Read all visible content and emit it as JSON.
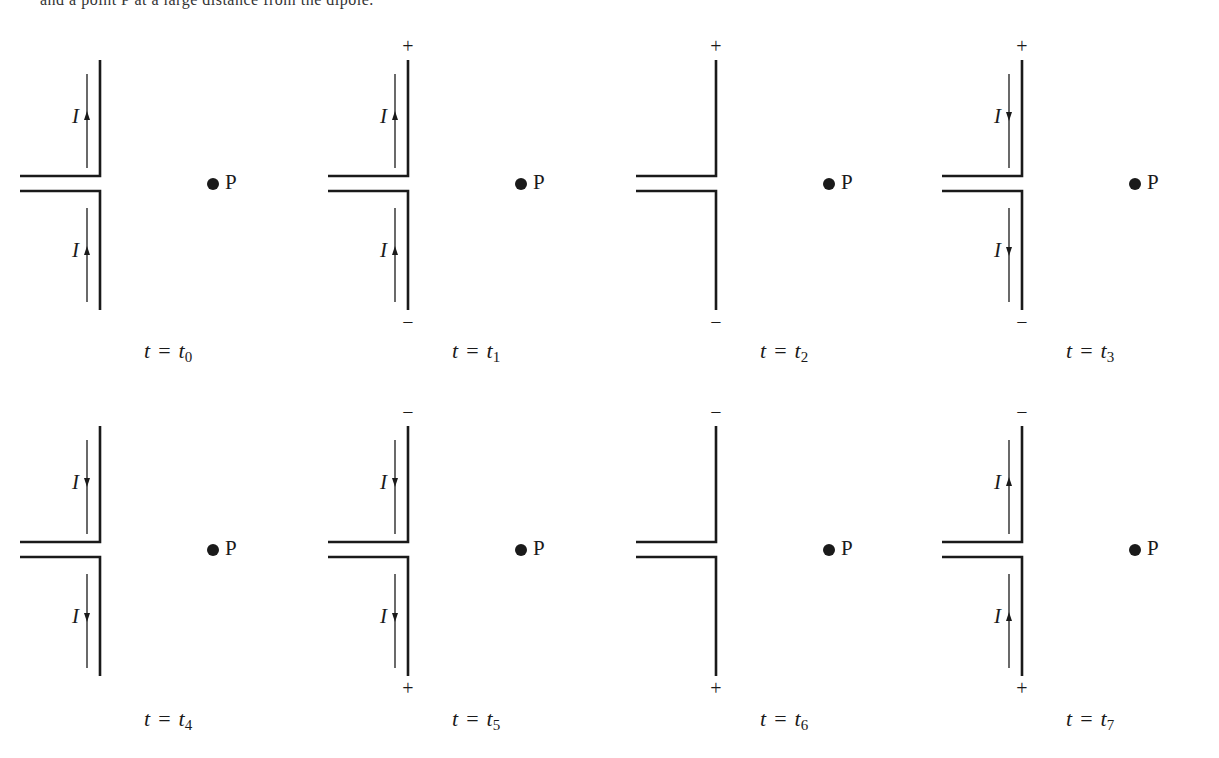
{
  "figure": {
    "cutoff_text": "and a point P at a large distance from the dipole.",
    "point_label": "P",
    "current_label": "I",
    "equals": "=",
    "time_symbol": "t",
    "panels": [
      {
        "id": "t0",
        "row": 0,
        "col": 0,
        "subscript": "0",
        "top_sign": "",
        "bottom_sign": "",
        "current": "up"
      },
      {
        "id": "t1",
        "row": 0,
        "col": 1,
        "subscript": "1",
        "top_sign": "+",
        "bottom_sign": "−",
        "current": "up"
      },
      {
        "id": "t2",
        "row": 0,
        "col": 2,
        "subscript": "2",
        "top_sign": "+",
        "bottom_sign": "−",
        "current": "none"
      },
      {
        "id": "t3",
        "row": 0,
        "col": 3,
        "subscript": "3",
        "top_sign": "+",
        "bottom_sign": "−",
        "current": "down"
      },
      {
        "id": "t4",
        "row": 1,
        "col": 0,
        "subscript": "4",
        "top_sign": "",
        "bottom_sign": "",
        "current": "down"
      },
      {
        "id": "t5",
        "row": 1,
        "col": 1,
        "subscript": "5",
        "top_sign": "−",
        "bottom_sign": "+",
        "current": "down"
      },
      {
        "id": "t6",
        "row": 1,
        "col": 2,
        "subscript": "6",
        "top_sign": "−",
        "bottom_sign": "+",
        "current": "none"
      },
      {
        "id": "t7",
        "row": 1,
        "col": 3,
        "subscript": "7",
        "top_sign": "−",
        "bottom_sign": "+",
        "current": "up"
      }
    ]
  },
  "colors": {
    "line": "#1a1a1a",
    "background": "#ffffff"
  }
}
